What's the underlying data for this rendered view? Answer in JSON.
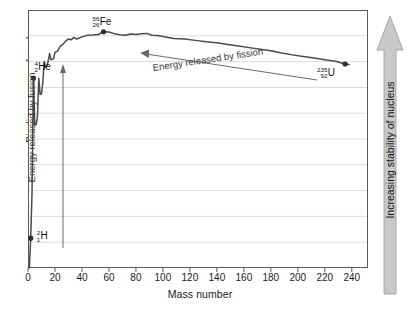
{
  "chart_data": {
    "type": "line",
    "title": "",
    "xlabel": "Mass number",
    "ylabel": "Binding energy of nucleus",
    "xlim": [
      0,
      252
    ],
    "ylim": [
      0,
      9.6
    ],
    "xticks": [
      0,
      20,
      40,
      60,
      80,
      100,
      120,
      140,
      160,
      180,
      200,
      220,
      240
    ],
    "yticks": [],
    "grid": "horizontal",
    "gridlines": 10,
    "legend": "none",
    "series": [
      {
        "name": "Binding energy per nucleon",
        "x": [
          1,
          2,
          3,
          4,
          5,
          6,
          7,
          8,
          9,
          10,
          11,
          12,
          13,
          14,
          15,
          16,
          17,
          18,
          19,
          20,
          22,
          24,
          26,
          28,
          30,
          32,
          34,
          36,
          38,
          40,
          44,
          48,
          52,
          56,
          60,
          64,
          68,
          72,
          76,
          80,
          84,
          88,
          92,
          96,
          100,
          108,
          116,
          124,
          132,
          140,
          148,
          156,
          164,
          172,
          180,
          188,
          196,
          204,
          212,
          220,
          228,
          235,
          238
        ],
        "y": [
          0.0,
          1.11,
          2.83,
          7.07,
          5.33,
          5.33,
          5.61,
          7.06,
          6.46,
          6.48,
          6.93,
          7.68,
          7.47,
          7.52,
          7.7,
          7.98,
          7.75,
          7.77,
          7.79,
          8.03,
          8.07,
          8.26,
          8.33,
          8.45,
          8.52,
          8.49,
          8.58,
          8.52,
          8.56,
          8.6,
          8.66,
          8.67,
          8.69,
          8.79,
          8.78,
          8.72,
          8.68,
          8.66,
          8.71,
          8.69,
          8.72,
          8.73,
          8.66,
          8.65,
          8.61,
          8.54,
          8.52,
          8.47,
          8.42,
          8.38,
          8.32,
          8.26,
          8.2,
          8.14,
          8.08,
          8.0,
          7.93,
          7.87,
          7.81,
          7.75,
          7.69,
          7.59,
          7.57
        ]
      }
    ],
    "points": [
      {
        "label": "H-2",
        "mass": 2,
        "value": 1.11
      },
      {
        "label": "He-4",
        "mass": 4,
        "value": 7.07
      },
      {
        "label": "Fe-56",
        "mass": 56,
        "value": 8.79
      },
      {
        "label": "U-235",
        "mass": 235,
        "value": 7.59
      }
    ],
    "annotations": [
      {
        "text": "Energy released by fusion",
        "direction": "up"
      },
      {
        "text": "Energy released by fission",
        "direction": "left"
      }
    ]
  },
  "axes": {
    "xlabel": "Mass number",
    "ylabel": "Binding energy of nucleus",
    "xticks": [
      "0",
      "20",
      "40",
      "60",
      "80",
      "100",
      "120",
      "140",
      "160",
      "180",
      "200",
      "220",
      "240"
    ]
  },
  "isotopes": {
    "hydrogen": {
      "mass": "2",
      "atomic": "1",
      "symbol": "H"
    },
    "helium": {
      "mass": "4",
      "atomic": "2",
      "symbol": "He"
    },
    "iron": {
      "mass": "56",
      "atomic": "26",
      "symbol": "Fe"
    },
    "uranium": {
      "mass": "235",
      "atomic": "92",
      "symbol": "U"
    }
  },
  "annotations": {
    "fusion": "Energy released by fusion",
    "fission": "Energy released by fission",
    "stability": "Increasing stability of nucleus"
  },
  "colors": {
    "curve": "#4a4a4a",
    "frame": "#5a5a5a",
    "grid": "#dcdcdc",
    "arrow_fill": "#c8c8c8",
    "annotation_text": "#3a3a3a"
  }
}
